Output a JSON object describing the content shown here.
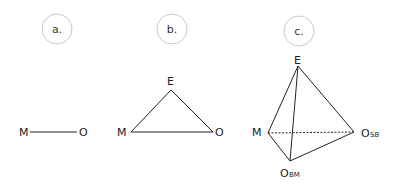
{
  "panels": [
    {
      "id": "a",
      "label": "a."
    },
    {
      "id": "b",
      "label": "b."
    },
    {
      "id": "c",
      "label": "c."
    }
  ],
  "diagram_a": {
    "nodes": [
      {
        "name": "M",
        "sub": ""
      },
      {
        "name": "O",
        "sub": ""
      }
    ]
  },
  "diagram_b": {
    "nodes": [
      {
        "name": "E",
        "sub": ""
      },
      {
        "name": "M",
        "sub": ""
      },
      {
        "name": "O",
        "sub": ""
      }
    ]
  },
  "diagram_c": {
    "nodes": [
      {
        "name": "E",
        "sub": ""
      },
      {
        "name": "M",
        "sub": ""
      },
      {
        "name": "O",
        "sub": "SB"
      },
      {
        "name": "O",
        "sub": "BM"
      }
    ]
  },
  "colors": {
    "line": "#222222",
    "circle": "#c8c8c8"
  }
}
